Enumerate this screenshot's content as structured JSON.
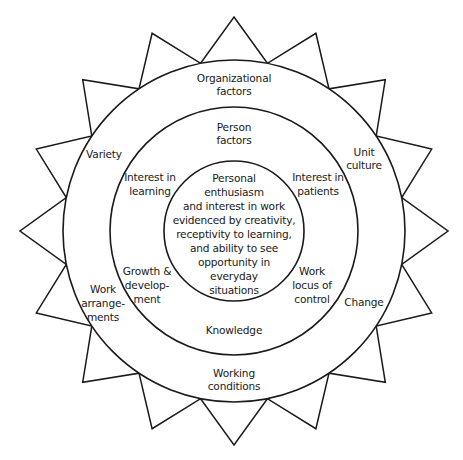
{
  "diagram": {
    "type": "concentric-circles-with-star-border",
    "center": {
      "x": 234,
      "y": 231
    },
    "colors": {
      "stroke": "#1a1a1a",
      "background": "#ffffff"
    },
    "star": {
      "points": 16,
      "tip_radius": 214,
      "base_radius": 171
    },
    "rings": [
      {
        "name": "outer-ring",
        "radius": 171,
        "title": "Organizational factors"
      },
      {
        "name": "middle-ring",
        "radius": 124,
        "title": "Person factors"
      },
      {
        "name": "inner-ring",
        "radius": 70,
        "title": "Core"
      }
    ],
    "labels": {
      "organizational_factors": [
        "Organizational",
        "factors"
      ],
      "person_factors": [
        "Person",
        "factors"
      ],
      "core": [
        "Personal",
        "enthusiasm",
        "and interest in work",
        "evidenced by creativity,",
        "receptivity to learning,",
        "and ability to see",
        "opportunity in",
        "everyday",
        "situations"
      ],
      "variety": [
        "Variety"
      ],
      "unit_culture": [
        "Unit",
        "culture"
      ],
      "interest_in_learning": [
        "Interest in",
        "learning"
      ],
      "interest_in_patients": [
        "Interest in",
        "patients"
      ],
      "growth_development": [
        "Growth &",
        "develop-",
        "ment"
      ],
      "work_locus_of_control": [
        "Work",
        "locus of",
        "control"
      ],
      "work_arrangements": [
        "Work",
        "arrange-",
        "ments"
      ],
      "change": [
        "Change"
      ],
      "knowledge": [
        "Knowledge"
      ],
      "working_conditions": [
        "Working",
        "conditions"
      ]
    }
  }
}
